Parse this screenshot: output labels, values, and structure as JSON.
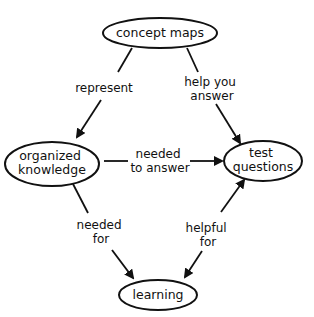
{
  "diagram": {
    "type": "concept-map",
    "nodes": {
      "concept_maps": {
        "lines": [
          "concept maps"
        ]
      },
      "organized_knowledge": {
        "lines": [
          "organized",
          "knowledge"
        ]
      },
      "test_questions": {
        "lines": [
          "test",
          "questions"
        ]
      },
      "learning": {
        "lines": [
          "learning"
        ]
      }
    },
    "edges": {
      "represent": {
        "from": "concept maps",
        "to": "organized knowledge",
        "lines": [
          "represent"
        ]
      },
      "help_you_answer": {
        "from": "concept maps",
        "to": "test questions",
        "lines": [
          "help you",
          "answer"
        ]
      },
      "needed_to_answer": {
        "from": "organized knowledge",
        "to": "test questions",
        "lines": [
          "needed",
          "to answer"
        ]
      },
      "needed_for": {
        "from": "organized knowledge",
        "to": "learning",
        "lines": [
          "needed",
          "for"
        ]
      },
      "helpful_for": {
        "from": "test questions",
        "to": "learning",
        "lines": [
          "helpful",
          "for"
        ],
        "bidirectional": true
      }
    }
  }
}
